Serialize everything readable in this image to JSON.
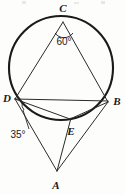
{
  "figure": {
    "kind": "circle-geometry-diagram",
    "background_color": "#fdfdfc",
    "stroke_color": "#1a1a1a",
    "thin_stroke_color": "#3a3a3a"
  },
  "circle": {
    "name": "main-circle",
    "cx": 61,
    "cy": 68,
    "r": 52,
    "stroke_width": 2.1
  },
  "points": [
    {
      "id": "C",
      "label": "C",
      "x": 63,
      "y": 22,
      "label_x": 63,
      "label_y": 11,
      "on_circle": true
    },
    {
      "id": "D",
      "label": "D",
      "x": 15,
      "y": 99,
      "label_x": 7,
      "label_y": 101,
      "on_circle": true
    },
    {
      "id": "B",
      "label": "B",
      "x": 108,
      "y": 102,
      "label_x": 116,
      "label_y": 104,
      "on_circle": true
    },
    {
      "id": "E",
      "label": "E",
      "x": 70,
      "y": 119,
      "label_x": 71,
      "label_y": 134,
      "on_circle": true
    },
    {
      "id": "A",
      "label": "A",
      "x": 57,
      "y": 171,
      "label_x": 56,
      "label_y": 188,
      "on_circle": false
    }
  ],
  "segments": [
    {
      "name": "chord-C-D",
      "from": "C",
      "to": "D",
      "width": 1.0
    },
    {
      "name": "chord-C-B",
      "from": "C",
      "to": "B",
      "width": 1.0
    },
    {
      "name": "chord-D-B",
      "from": "D",
      "to": "B",
      "width": 1.0
    },
    {
      "name": "chord-D-E",
      "from": "D",
      "to": "E",
      "width": 1.0
    },
    {
      "name": "chord-E-B",
      "from": "E",
      "to": "B",
      "width": 1.0
    },
    {
      "name": "secant-A-D",
      "from": "A",
      "to": "D",
      "width": 1.0
    },
    {
      "name": "secant-A-B",
      "from": "A",
      "to": "B",
      "width": 1.0
    },
    {
      "name": "segment-A-through-E",
      "from": "A",
      "to": "E",
      "width": 1.0
    }
  ],
  "angles": [
    {
      "name": "angle-at-C",
      "value": "60°",
      "vertex": "C",
      "label_x": 64,
      "label_y": 42,
      "arc_path": "M 55 33 A 11 11 0 0 0 73 33",
      "has_leader": false
    },
    {
      "name": "angle-at-D",
      "value": "35°",
      "vertex": "D",
      "label_x": 17,
      "label_y": 137,
      "arc_path": "M 21 104 A 9 9 0 0 0 23 111",
      "has_leader": true,
      "leader_path": "M 28 129 L 23 110"
    }
  ],
  "labels_font_size": 11,
  "angle_font_size": 10
}
